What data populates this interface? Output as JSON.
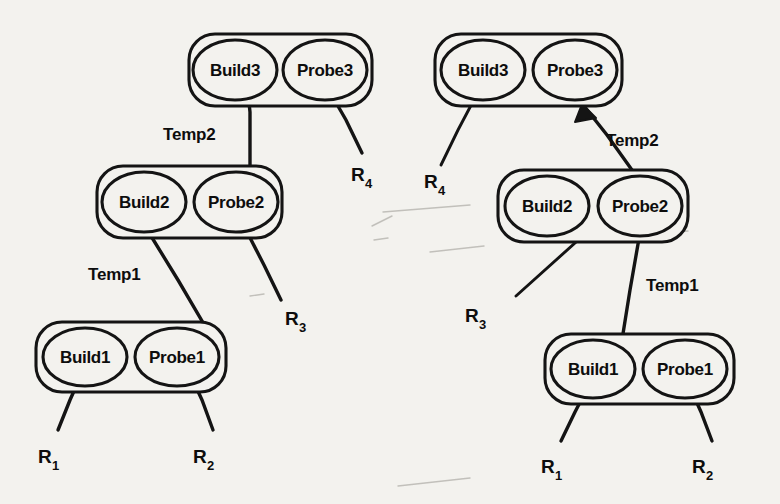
{
  "figure": {
    "background_color": "#f3f2ee",
    "ink_color": "#141414"
  },
  "diagrams": [
    {
      "id": "left",
      "name": "left-plan-tree",
      "groups": [
        {
          "id": "left-level3",
          "name": "group-build3-probe3",
          "nodes": [
            {
              "id": "left-build3",
              "label": "Build3"
            },
            {
              "id": "left-probe3",
              "label": "Probe3"
            }
          ]
        },
        {
          "id": "left-level2",
          "name": "group-build2-probe2",
          "nodes": [
            {
              "id": "left-build2",
              "label": "Build2"
            },
            {
              "id": "left-probe2",
              "label": "Probe2"
            }
          ]
        },
        {
          "id": "left-level1",
          "name": "group-build1-probe1",
          "nodes": [
            {
              "id": "left-build1",
              "label": "Build1"
            },
            {
              "id": "left-probe1",
              "label": "Probe1"
            }
          ]
        }
      ],
      "edge_labels": [
        {
          "id": "left-temp2",
          "label": "Temp2"
        },
        {
          "id": "left-temp1",
          "label": "Temp1"
        }
      ],
      "leaves": [
        {
          "id": "left-r1",
          "base": "R",
          "sub": "1"
        },
        {
          "id": "left-r2",
          "base": "R",
          "sub": "2"
        },
        {
          "id": "left-r3",
          "base": "R",
          "sub": "3"
        },
        {
          "id": "left-r4",
          "base": "R",
          "sub": "4"
        }
      ]
    },
    {
      "id": "right",
      "name": "right-plan-tree",
      "groups": [
        {
          "id": "right-level3",
          "name": "group-build3-probe3",
          "nodes": [
            {
              "id": "right-build3",
              "label": "Build3"
            },
            {
              "id": "right-probe3",
              "label": "Probe3"
            }
          ]
        },
        {
          "id": "right-level2",
          "name": "group-build2-probe2",
          "nodes": [
            {
              "id": "right-build2",
              "label": "Build2"
            },
            {
              "id": "right-probe2",
              "label": "Probe2"
            }
          ]
        },
        {
          "id": "right-level1",
          "name": "group-build1-probe1",
          "nodes": [
            {
              "id": "right-build1",
              "label": "Build1"
            },
            {
              "id": "right-probe1",
              "label": "Probe1"
            }
          ]
        }
      ],
      "edge_labels": [
        {
          "id": "right-temp2",
          "label": "Temp2"
        },
        {
          "id": "right-temp1",
          "label": "Temp1"
        }
      ],
      "leaves": [
        {
          "id": "right-r1",
          "base": "R",
          "sub": "1"
        },
        {
          "id": "right-r2",
          "base": "R",
          "sub": "2"
        },
        {
          "id": "right-r3",
          "base": "R",
          "sub": "3"
        },
        {
          "id": "right-r4",
          "base": "R",
          "sub": "4"
        }
      ]
    }
  ]
}
